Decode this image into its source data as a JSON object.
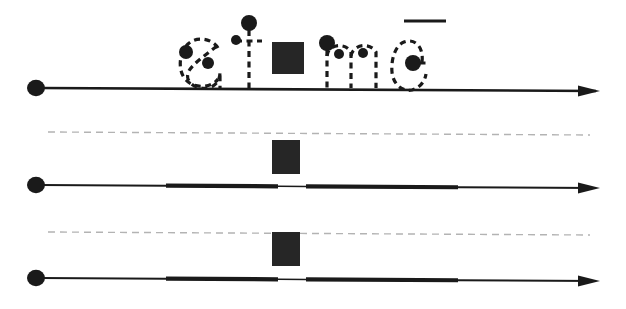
{
  "figure": {
    "background_color": "#ffffff",
    "ink_color": "#1a1a1a",
    "dash_color": "#1a1a1a",
    "guide_color": "#b3b3b3",
    "redaction_color": "#262626",
    "width": 626,
    "height": 309
  },
  "handwriting": {
    "word": "aime",
    "baseline_y": 88,
    "letters": [
      {
        "name": "letter-a",
        "char": "a",
        "x": 178,
        "width": 48
      },
      {
        "name": "letter-i",
        "char": "i",
        "x": 238,
        "width": 20
      },
      {
        "name": "letter-m",
        "char": "m",
        "x": 315,
        "width": 62
      },
      {
        "name": "letter-e",
        "char": "e",
        "x": 398,
        "width": 48
      }
    ],
    "pen_down_dots": [
      {
        "name": "dot-a-start",
        "cx": 186,
        "cy": 52,
        "r": 7
      },
      {
        "name": "dot-a-mid",
        "cx": 208,
        "cy": 63,
        "r": 6
      },
      {
        "name": "dot-i-tittle",
        "cx": 236,
        "cy": 40,
        "r": 5
      },
      {
        "name": "dot-i-stem",
        "cx": 249,
        "cy": 23,
        "r": 8
      },
      {
        "name": "dot-m-start",
        "cx": 327,
        "cy": 43,
        "r": 8
      },
      {
        "name": "dot-m-arch1",
        "cx": 339,
        "cy": 54,
        "r": 5
      },
      {
        "name": "dot-m-arch2",
        "cx": 363,
        "cy": 53,
        "r": 5
      },
      {
        "name": "dot-e-center",
        "cx": 413,
        "cy": 63,
        "r": 8
      }
    ],
    "overline_mark": {
      "name": "overline-mark",
      "x1": 404,
      "x2": 446,
      "y": 21,
      "thickness": 3
    }
  },
  "redaction_blocks": [
    {
      "name": "redaction-block-row1",
      "x": 272,
      "y": 42,
      "width": 32,
      "height": 32
    },
    {
      "name": "redaction-block-row2",
      "x": 272,
      "y": 140,
      "width": 28,
      "height": 34
    },
    {
      "name": "redaction-block-row3",
      "x": 272,
      "y": 232,
      "width": 28,
      "height": 34
    }
  ],
  "timelines": [
    {
      "name": "timeline-row-1",
      "index": 1,
      "axis_y": 88,
      "start_dot": {
        "cx": 36,
        "cy": 88,
        "r": 9
      },
      "arrow_x": 600,
      "line_start_x": 36,
      "guide_line": null,
      "segments": [
        {
          "name": "segment-1",
          "x1": 40,
          "x2": 596,
          "thickness": 2.6
        }
      ]
    },
    {
      "name": "timeline-row-2",
      "index": 2,
      "axis_y": 185,
      "start_dot": {
        "cx": 36,
        "cy": 185,
        "r": 9
      },
      "arrow_x": 600,
      "line_start_x": 36,
      "guide_line": {
        "name": "guide-dashed-row2",
        "x1": 48,
        "y": 132,
        "x2": 590
      },
      "segments": [
        {
          "name": "segment-1",
          "x1": 40,
          "x2": 166,
          "thickness": 2.0
        },
        {
          "name": "segment-2",
          "x1": 166,
          "x2": 278,
          "thickness": 4.2
        },
        {
          "name": "segment-3",
          "x1": 278,
          "x2": 306,
          "thickness": 1.6
        },
        {
          "name": "segment-4",
          "x1": 306,
          "x2": 458,
          "thickness": 4.2
        },
        {
          "name": "segment-5",
          "x1": 458,
          "x2": 596,
          "thickness": 2.0
        }
      ]
    },
    {
      "name": "timeline-row-3",
      "index": 3,
      "axis_y": 278,
      "start_dot": {
        "cx": 36,
        "cy": 278,
        "r": 9
      },
      "arrow_x": 600,
      "line_start_x": 36,
      "guide_line": {
        "name": "guide-dashed-row3",
        "x1": 48,
        "y": 232,
        "x2": 590
      },
      "segments": [
        {
          "name": "segment-1",
          "x1": 40,
          "x2": 166,
          "thickness": 2.0
        },
        {
          "name": "segment-2",
          "x1": 166,
          "x2": 278,
          "thickness": 4.2
        },
        {
          "name": "segment-3",
          "x1": 278,
          "x2": 306,
          "thickness": 1.6
        },
        {
          "name": "segment-4",
          "x1": 306,
          "x2": 458,
          "thickness": 4.2
        },
        {
          "name": "segment-5",
          "x1": 458,
          "x2": 596,
          "thickness": 2.0
        }
      ]
    }
  ],
  "accessibility": {
    "figure_caption": "",
    "word_label": "aime"
  }
}
